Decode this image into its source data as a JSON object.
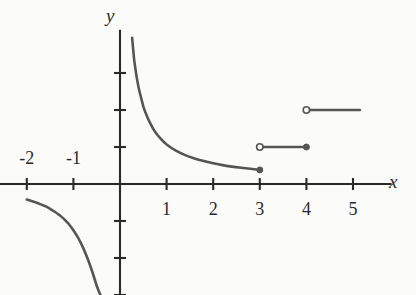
{
  "figure": {
    "title": "",
    "background_color": "#fbfbfa",
    "ink_color": "#555555",
    "axis_color": "#2a2a2a",
    "text_color": "#2a2a2a"
  },
  "axes": {
    "x_axis_label": "x",
    "y_axis_label": "y",
    "x_ticks": [
      {
        "value": -2,
        "label": "-2",
        "label_side": "above"
      },
      {
        "value": -1,
        "label": "-1",
        "label_side": "above"
      },
      {
        "value": 1,
        "label": "1",
        "label_side": "below"
      },
      {
        "value": 2,
        "label": "2",
        "label_side": "below"
      },
      {
        "value": 3,
        "label": "3",
        "label_side": "below"
      },
      {
        "value": 4,
        "label": "4",
        "label_side": "below"
      },
      {
        "value": 5,
        "label": "5",
        "label_side": "below"
      }
    ],
    "y_ticks": [
      {
        "value": 3,
        "label": ""
      },
      {
        "value": 2,
        "label": ""
      },
      {
        "value": 1,
        "label": ""
      },
      {
        "value": -1,
        "label": ""
      },
      {
        "value": -2,
        "label": ""
      },
      {
        "value": -3,
        "label": ""
      }
    ]
  },
  "chart_data": {
    "type": "line",
    "title": "",
    "xlabel": "x",
    "ylabel": "y",
    "xlim": [
      -2.6,
      6.3
    ],
    "ylim": [
      -3.0,
      3.95
    ],
    "grid": false,
    "legend": "none",
    "series": [
      {
        "name": "hyperbola-branch-positive",
        "kind": "curve",
        "description": "reciprocal curve y = 1/x on 0 < x <= 3, closed (filled) endpoint at x = 3",
        "x": [
          0.26,
          0.3,
          0.35,
          0.4,
          0.5,
          0.6,
          0.7,
          0.8,
          0.9,
          1.0,
          1.2,
          1.4,
          1.6,
          1.8,
          2.0,
          2.2,
          2.4,
          2.6,
          2.8,
          3.0
        ],
        "y": [
          3.95,
          3.4,
          2.95,
          2.6,
          2.1,
          1.77,
          1.52,
          1.33,
          1.19,
          1.07,
          0.9,
          0.78,
          0.69,
          0.62,
          0.56,
          0.51,
          0.47,
          0.44,
          0.41,
          0.38
        ],
        "start_marker": "none",
        "end_marker": "filled"
      },
      {
        "name": "hyperbola-branch-negative",
        "kind": "curve",
        "description": "reciprocal curve y = 1/x for x < 0, entering from the left edge and falling off the bottom near the y-axis",
        "x": [
          -2.0,
          -1.9,
          -1.8,
          -1.7,
          -1.6,
          -1.5,
          -1.4,
          -1.3,
          -1.2,
          -1.1,
          -1.0,
          -0.9,
          -0.8,
          -0.7,
          -0.6,
          -0.5,
          -0.42
        ],
        "y": [
          -0.42,
          -0.46,
          -0.5,
          -0.55,
          -0.6,
          -0.67,
          -0.75,
          -0.84,
          -0.95,
          -1.08,
          -1.25,
          -1.45,
          -1.7,
          -2.0,
          -2.35,
          -2.75,
          -3.0
        ],
        "start_marker": "none",
        "end_marker": "none"
      },
      {
        "name": "step-segment-1",
        "kind": "segment",
        "description": "horizontal segment at y = 1 from x = 3 (open) to x = 4 (filled)",
        "x": [
          3,
          4
        ],
        "y": [
          1,
          1
        ],
        "start_marker": "open",
        "end_marker": "filled"
      },
      {
        "name": "step-segment-2",
        "kind": "segment",
        "description": "horizontal segment at y = 2 from x = 4 (open) to x = 5.15 (no marker)",
        "x": [
          4,
          5.15
        ],
        "y": [
          2,
          2
        ],
        "start_marker": "open",
        "end_marker": "none"
      }
    ],
    "annotations": []
  }
}
